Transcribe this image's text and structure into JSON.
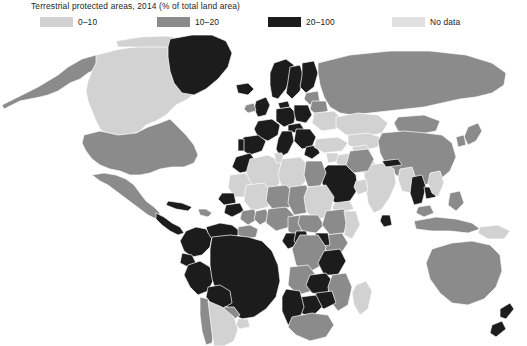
{
  "legend": {
    "title": "Terrestrial protected areas, 2014 (% of total land area)",
    "items": [
      {
        "label": "0–10",
        "color": "#d2d2d2",
        "key": "low"
      },
      {
        "label": "10–20",
        "color": "#8b8b8b",
        "key": "mid"
      },
      {
        "label": "20–100",
        "color": "#1c1c1c",
        "key": "high"
      },
      {
        "label": "No data",
        "color": "#e0e0e0",
        "key": "nodata"
      }
    ]
  },
  "map": {
    "name": "world-choropleth",
    "ocean_color": "#ffffff",
    "border_color": "#ffffff",
    "projection": "robinson",
    "categories": {
      "low": "#d2d2d2",
      "mid": "#8b8b8b",
      "high": "#1c1c1c",
      "nodata": "#e0e0e0"
    },
    "regions": [
      {
        "name": "Greenland",
        "category": "high"
      },
      {
        "name": "Canada",
        "category": "low"
      },
      {
        "name": "Alaska",
        "category": "mid"
      },
      {
        "name": "United States",
        "category": "mid"
      },
      {
        "name": "Mexico",
        "category": "mid"
      },
      {
        "name": "Central America",
        "category": "high"
      },
      {
        "name": "Cuba",
        "category": "high"
      },
      {
        "name": "Caribbean",
        "category": "mid"
      },
      {
        "name": "Colombia",
        "category": "high"
      },
      {
        "name": "Venezuela",
        "category": "high"
      },
      {
        "name": "Guyanas",
        "category": "mid"
      },
      {
        "name": "Ecuador",
        "category": "high"
      },
      {
        "name": "Peru",
        "category": "high"
      },
      {
        "name": "Brazil",
        "category": "high"
      },
      {
        "name": "Bolivia",
        "category": "high"
      },
      {
        "name": "Paraguay",
        "category": "mid"
      },
      {
        "name": "Chile",
        "category": "mid"
      },
      {
        "name": "Argentina",
        "category": "low"
      },
      {
        "name": "Uruguay",
        "category": "low"
      },
      {
        "name": "Iceland",
        "category": "high"
      },
      {
        "name": "United Kingdom",
        "category": "high"
      },
      {
        "name": "Ireland",
        "category": "mid"
      },
      {
        "name": "Norway",
        "category": "high"
      },
      {
        "name": "Sweden",
        "category": "high"
      },
      {
        "name": "Finland",
        "category": "high"
      },
      {
        "name": "Denmark",
        "category": "high"
      },
      {
        "name": "Germany",
        "category": "high"
      },
      {
        "name": "Poland",
        "category": "high"
      },
      {
        "name": "France",
        "category": "high"
      },
      {
        "name": "Spain",
        "category": "high"
      },
      {
        "name": "Portugal",
        "category": "high"
      },
      {
        "name": "Italy",
        "category": "high"
      },
      {
        "name": "Balkans",
        "category": "high"
      },
      {
        "name": "Greece",
        "category": "high"
      },
      {
        "name": "Austria",
        "category": "high"
      },
      {
        "name": "Baltics",
        "category": "mid"
      },
      {
        "name": "Belarus",
        "category": "mid"
      },
      {
        "name": "Ukraine",
        "category": "low"
      },
      {
        "name": "Turkey",
        "category": "low"
      },
      {
        "name": "Russia",
        "category": "mid"
      },
      {
        "name": "Kazakhstan",
        "category": "low"
      },
      {
        "name": "Central Asia",
        "category": "low"
      },
      {
        "name": "Mongolia",
        "category": "mid"
      },
      {
        "name": "China",
        "category": "mid"
      },
      {
        "name": "Japan",
        "category": "mid"
      },
      {
        "name": "Korea",
        "category": "mid"
      },
      {
        "name": "India",
        "category": "low"
      },
      {
        "name": "Nepal",
        "category": "high"
      },
      {
        "name": "Sri Lanka",
        "category": "high"
      },
      {
        "name": "Myanmar",
        "category": "low"
      },
      {
        "name": "Thailand",
        "category": "high"
      },
      {
        "name": "Cambodia",
        "category": "high"
      },
      {
        "name": "Vietnam",
        "category": "low"
      },
      {
        "name": "Malaysia",
        "category": "mid"
      },
      {
        "name": "Indonesia",
        "category": "mid"
      },
      {
        "name": "Philippines",
        "category": "mid"
      },
      {
        "name": "Papua New Guinea",
        "category": "low"
      },
      {
        "name": "Australia",
        "category": "mid"
      },
      {
        "name": "New Zealand",
        "category": "high"
      },
      {
        "name": "Morocco",
        "category": "high"
      },
      {
        "name": "Algeria",
        "category": "low"
      },
      {
        "name": "Tunisia",
        "category": "low"
      },
      {
        "name": "Libya",
        "category": "low"
      },
      {
        "name": "Egypt",
        "category": "mid"
      },
      {
        "name": "Mauritania",
        "category": "low"
      },
      {
        "name": "Mali",
        "category": "low"
      },
      {
        "name": "Niger",
        "category": "mid"
      },
      {
        "name": "Chad",
        "category": "mid"
      },
      {
        "name": "Sudan",
        "category": "low"
      },
      {
        "name": "Senegal",
        "category": "high"
      },
      {
        "name": "Guinea",
        "category": "high"
      },
      {
        "name": "Ivory Coast",
        "category": "mid"
      },
      {
        "name": "Ghana",
        "category": "mid"
      },
      {
        "name": "Nigeria",
        "category": "mid"
      },
      {
        "name": "Cameroon",
        "category": "mid"
      },
      {
        "name": "Central African Rep.",
        "category": "mid"
      },
      {
        "name": "Ethiopia",
        "category": "mid"
      },
      {
        "name": "Somalia",
        "category": "low"
      },
      {
        "name": "Kenya",
        "category": "mid"
      },
      {
        "name": "Uganda",
        "category": "high"
      },
      {
        "name": "Congo",
        "category": "high"
      },
      {
        "name": "DR Congo",
        "category": "mid"
      },
      {
        "name": "Gabon",
        "category": "high"
      },
      {
        "name": "Angola",
        "category": "mid"
      },
      {
        "name": "Zambia",
        "category": "high"
      },
      {
        "name": "Tanzania",
        "category": "high"
      },
      {
        "name": "Mozambique",
        "category": "mid"
      },
      {
        "name": "Zimbabwe",
        "category": "high"
      },
      {
        "name": "Botswana",
        "category": "high"
      },
      {
        "name": "Namibia",
        "category": "high"
      },
      {
        "name": "South Africa",
        "category": "mid"
      },
      {
        "name": "Madagascar",
        "category": "low"
      },
      {
        "name": "Saudi Arabia",
        "category": "high"
      },
      {
        "name": "Yemen",
        "category": "low"
      },
      {
        "name": "Oman",
        "category": "low"
      },
      {
        "name": "Iran",
        "category": "mid"
      },
      {
        "name": "Iraq",
        "category": "low"
      },
      {
        "name": "Syria",
        "category": "low"
      },
      {
        "name": "Afghanistan",
        "category": "low"
      },
      {
        "name": "Pakistan",
        "category": "low"
      }
    ]
  }
}
